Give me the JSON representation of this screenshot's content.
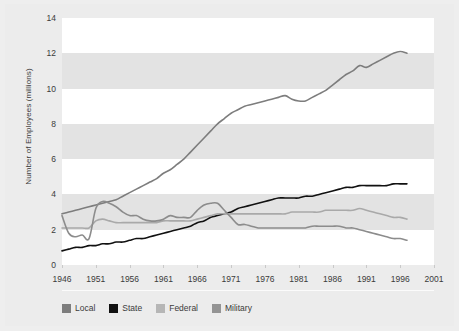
{
  "chart_data": {
    "type": "line",
    "title": "",
    "xlabel": "",
    "ylabel": "Number of Employees (millions)",
    "xlim": [
      1946,
      2001
    ],
    "ylim": [
      0,
      14
    ],
    "xticks": [
      "1946",
      "1951",
      "1956",
      "1961",
      "1966",
      "1971",
      "1976",
      "1981",
      "1986",
      "1991",
      "1996",
      "2001"
    ],
    "yticks": [
      "0",
      "2",
      "4",
      "6",
      "8",
      "10",
      "12",
      "14"
    ],
    "grid": "horizontal-alternating-bands",
    "legend_position": "bottom-left",
    "x": [
      1946,
      1947,
      1948,
      1949,
      1950,
      1951,
      1952,
      1953,
      1954,
      1955,
      1956,
      1957,
      1958,
      1959,
      1960,
      1961,
      1962,
      1963,
      1964,
      1965,
      1966,
      1967,
      1968,
      1969,
      1970,
      1971,
      1972,
      1973,
      1974,
      1975,
      1976,
      1977,
      1978,
      1979,
      1980,
      1981,
      1982,
      1983,
      1984,
      1985,
      1986,
      1987,
      1988,
      1989,
      1990,
      1991,
      1992,
      1993,
      1994,
      1995,
      1996,
      1997
    ],
    "series": [
      {
        "name": "Local",
        "color": "#7d7d7d",
        "values": [
          2.9,
          3.0,
          3.1,
          3.2,
          3.3,
          3.4,
          3.5,
          3.6,
          3.7,
          3.9,
          4.1,
          4.3,
          4.5,
          4.7,
          4.9,
          5.2,
          5.4,
          5.7,
          6.0,
          6.4,
          6.8,
          7.2,
          7.6,
          8.0,
          8.3,
          8.6,
          8.8,
          9.0,
          9.1,
          9.2,
          9.3,
          9.4,
          9.5,
          9.6,
          9.4,
          9.3,
          9.3,
          9.5,
          9.7,
          9.9,
          10.2,
          10.5,
          10.8,
          11.0,
          11.3,
          11.2,
          11.4,
          11.6,
          11.8,
          12.0,
          12.1,
          12.0
        ]
      },
      {
        "name": "State",
        "color": "#111111",
        "values": [
          0.8,
          0.9,
          1.0,
          1.0,
          1.1,
          1.1,
          1.2,
          1.2,
          1.3,
          1.3,
          1.4,
          1.5,
          1.5,
          1.6,
          1.7,
          1.8,
          1.9,
          2.0,
          2.1,
          2.2,
          2.4,
          2.5,
          2.7,
          2.8,
          2.9,
          3.0,
          3.2,
          3.3,
          3.4,
          3.5,
          3.6,
          3.7,
          3.8,
          3.8,
          3.8,
          3.8,
          3.9,
          3.9,
          4.0,
          4.1,
          4.2,
          4.3,
          4.4,
          4.4,
          4.5,
          4.5,
          4.5,
          4.5,
          4.5,
          4.6,
          4.6,
          4.6
        ]
      },
      {
        "name": "Federal",
        "color": "#a9a9a9",
        "values": [
          2.1,
          2.1,
          2.1,
          2.1,
          2.1,
          2.5,
          2.6,
          2.5,
          2.4,
          2.4,
          2.4,
          2.4,
          2.4,
          2.4,
          2.4,
          2.5,
          2.5,
          2.5,
          2.5,
          2.5,
          2.6,
          2.7,
          2.8,
          2.9,
          2.9,
          2.9,
          2.9,
          2.9,
          2.9,
          2.9,
          2.9,
          2.9,
          2.9,
          2.9,
          3.0,
          3.0,
          3.0,
          3.0,
          3.0,
          3.1,
          3.1,
          3.1,
          3.1,
          3.1,
          3.2,
          3.1,
          3.0,
          2.9,
          2.8,
          2.7,
          2.7,
          2.6
        ]
      },
      {
        "name": "Military",
        "color": "#8c8c8c",
        "values": [
          2.8,
          1.8,
          1.6,
          1.7,
          1.5,
          3.2,
          3.6,
          3.5,
          3.3,
          3.0,
          2.8,
          2.8,
          2.6,
          2.5,
          2.5,
          2.6,
          2.8,
          2.7,
          2.7,
          2.7,
          3.1,
          3.4,
          3.5,
          3.5,
          3.1,
          2.7,
          2.3,
          2.3,
          2.2,
          2.1,
          2.1,
          2.1,
          2.1,
          2.1,
          2.1,
          2.1,
          2.1,
          2.2,
          2.2,
          2.2,
          2.2,
          2.2,
          2.1,
          2.1,
          2.0,
          1.9,
          1.8,
          1.7,
          1.6,
          1.5,
          1.5,
          1.4
        ]
      }
    ]
  },
  "legend": {
    "items": [
      {
        "label": "Local",
        "color": "#7d7d7d"
      },
      {
        "label": "State",
        "color": "#111111"
      },
      {
        "label": "Federal",
        "color": "#b6b6b6"
      },
      {
        "label": "Military",
        "color": "#949494"
      }
    ]
  },
  "axis": {
    "y_title": "Number of Employees (millions)"
  },
  "colors": {
    "figure_background": "#ececec",
    "band_light": "#ffffff",
    "band_dark": "#e3e3e3",
    "tick_text": "#3b3b3b"
  }
}
